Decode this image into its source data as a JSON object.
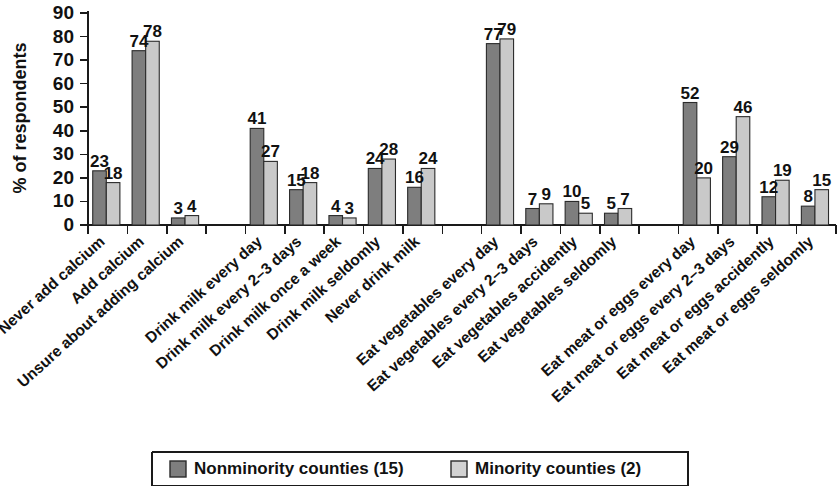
{
  "chart_data": {
    "type": "bar",
    "title": "",
    "xlabel": "",
    "ylabel": "% of respondents",
    "ylim": [
      0,
      90
    ],
    "yticks": [
      0,
      10,
      20,
      30,
      40,
      50,
      60,
      70,
      80,
      90
    ],
    "grid": false,
    "legend_position": "bottom",
    "categories": [
      "Never add calcium",
      "Add calcium",
      "Unsure about adding calcium",
      "Drink milk every day",
      "Drink milk every 2–3 days",
      "Drink milk once a week",
      "Drink milk seldomly",
      "Never drink milk",
      "Eat vegetables every day",
      "Eat vegetables every 2–3 days",
      "Eat vegetables accidently",
      "Eat vegetables seldomly",
      "Eat meat or eggs every day",
      "Eat meat or eggs every 2–3 days",
      "Eat meat or eggs accidently",
      "Eat meat or eggs seldomly"
    ],
    "group_breaks_after": [
      2,
      7,
      11
    ],
    "series": [
      {
        "name": "Nonminority counties (15)",
        "color": "#7e7e7e",
        "values": [
          23,
          74,
          3,
          41,
          15,
          4,
          24,
          16,
          77,
          7,
          10,
          5,
          52,
          29,
          12,
          8
        ]
      },
      {
        "name": "Minority counties (2)",
        "color": "#c9c9c9",
        "values": [
          18,
          78,
          4,
          27,
          18,
          3,
          28,
          24,
          79,
          9,
          5,
          7,
          20,
          46,
          19,
          15
        ]
      }
    ]
  },
  "legend": {
    "items": [
      {
        "label": "Nonminority counties (15)",
        "swatch": "dark-gray-swatch"
      },
      {
        "label": "Minority counties (2)",
        "swatch": "light-gray-swatch"
      }
    ]
  }
}
